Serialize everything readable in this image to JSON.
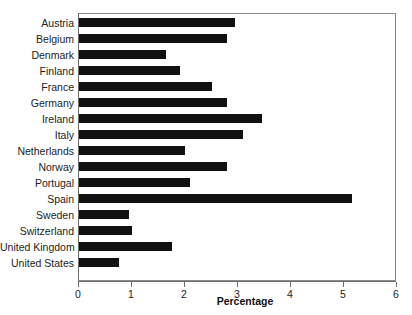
{
  "chart_data": {
    "type": "bar",
    "orientation": "horizontal",
    "title": "",
    "xlabel": "Percentage",
    "ylabel": "",
    "xlim": [
      0,
      6
    ],
    "xticks": [
      0,
      1,
      2,
      3,
      4,
      5,
      6
    ],
    "xtick_labels": [
      "0",
      "1",
      "2",
      "3",
      "4",
      "5",
      "6"
    ],
    "grid": false,
    "legend": null,
    "bar_color": "#111111",
    "categories": [
      "Austria",
      "Belgium",
      "Denmark",
      "Finland",
      "France",
      "Germany",
      "Ireland",
      "Italy",
      "Netherlands",
      "Norway",
      "Portugal",
      "Spain",
      "Sweden",
      "Switzerland",
      "United Kingdom",
      "United States"
    ],
    "values": [
      2.95,
      2.8,
      1.65,
      1.9,
      2.5,
      2.8,
      3.45,
      3.1,
      2.0,
      2.8,
      2.1,
      5.15,
      0.95,
      1.0,
      1.75,
      0.75
    ]
  }
}
